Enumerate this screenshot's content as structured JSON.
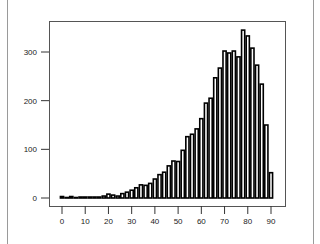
{
  "chart_data": {
    "type": "bar",
    "title": "",
    "xlabel": "",
    "ylabel": "",
    "xlim": [
      -3,
      95
    ],
    "ylim": [
      -15,
      365
    ],
    "bin_width": 2,
    "x_ticks": [
      0,
      10,
      20,
      30,
      40,
      50,
      60,
      70,
      80,
      90
    ],
    "y_ticks": [
      0,
      100,
      200,
      300
    ],
    "bin_starts": [
      0,
      2,
      4,
      6,
      8,
      10,
      12,
      14,
      16,
      18,
      20,
      22,
      24,
      26,
      28,
      30,
      32,
      34,
      36,
      38,
      40,
      42,
      44,
      46,
      48,
      50,
      52,
      54,
      56,
      58,
      60,
      62,
      64,
      66,
      68,
      70,
      72,
      74,
      76,
      78,
      80,
      82,
      84,
      86,
      88,
      90
    ],
    "values": [
      3,
      1,
      3,
      1,
      2,
      2,
      2,
      2,
      2,
      4,
      8,
      6,
      4,
      9,
      12,
      16,
      21,
      27,
      26,
      30,
      39,
      48,
      53,
      66,
      76,
      75,
      98,
      126,
      131,
      142,
      163,
      195,
      205,
      247,
      267,
      302,
      298,
      302,
      290,
      345,
      333,
      308,
      273,
      234,
      150,
      52
    ],
    "grid": false,
    "legend": null,
    "bar_fill": "#ffffff",
    "bar_edge": "#000000"
  }
}
